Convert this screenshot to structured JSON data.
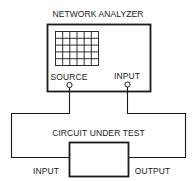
{
  "analyzer": {
    "title": "NETWORK ANALYZER",
    "ports": {
      "source": "SOURCE",
      "input": "INPUT"
    },
    "display_grid": {
      "columns": 6,
      "rows": 5
    }
  },
  "dut": {
    "title": "CIRCUIT UNDER TEST",
    "ports": {
      "input": "INPUT",
      "output": "OUTPUT"
    }
  },
  "colors": {
    "line": "#1a1a1a",
    "background": "#ffffff"
  }
}
